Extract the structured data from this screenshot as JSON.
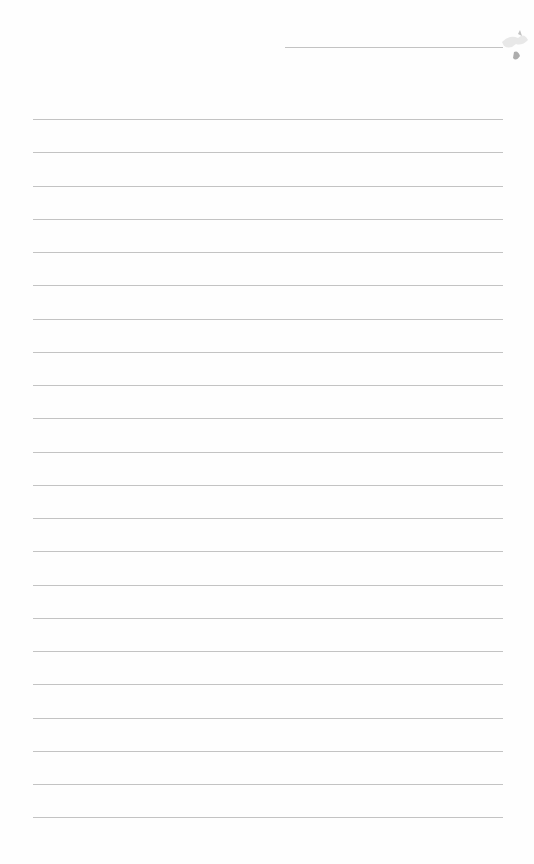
{
  "page": {
    "type": "blank lined paper",
    "background": "#fefefe",
    "rule_color": "#b8b8b8",
    "top_rule": {
      "y": 47,
      "x_start": 285,
      "x_end": 503
    },
    "rules": {
      "x_start": 33,
      "x_end": 503,
      "y_start": 119,
      "spacing": 33.25,
      "count": 22
    }
  }
}
